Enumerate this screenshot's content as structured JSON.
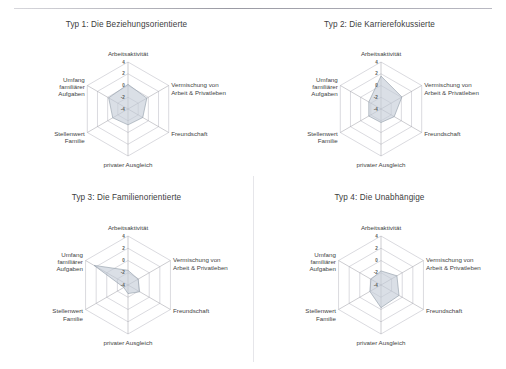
{
  "figure": {
    "kind": "radar-chart-grid",
    "panel_count": 4,
    "fill_color": "#c3ccd6",
    "grid_color": "#bcbcc4",
    "axis_color": "#9a9aa2",
    "text_color": "#3d3d3d"
  },
  "axes": {
    "labels": [
      "Arbeitsaktivität",
      "Vermischung von Arbeit & Privatleben",
      "Freundschaft",
      "privater Ausgleich",
      "Stellenwert Familie",
      "Umfang familiärer Aufgaben"
    ],
    "label_lines": [
      [
        "Arbeitsaktivität"
      ],
      [
        "Vermischung von",
        "Arbeit & Privatleben"
      ],
      [
        "Freundschaft"
      ],
      [
        "privater Ausgleich"
      ],
      [
        "Stellenwert",
        "Familie"
      ],
      [
        "Umfang",
        "familiärer",
        "Aufgaben"
      ]
    ],
    "ticks": [
      "4",
      "2",
      "0",
      "-2",
      "-4"
    ],
    "range": [
      -4,
      4
    ]
  },
  "chart_data": [
    {
      "type": "radar",
      "title": "Typ 1: Die Beziehungsorientierte",
      "categories": [
        "Arbeitsaktivität",
        "Vermischung von Arbeit & Privatleben",
        "Freundschaft",
        "privater Ausgleich",
        "Stellenwert Familie",
        "Umfang familiärer Aufgaben"
      ],
      "values": [
        0.2,
        -0.3,
        -1.1,
        -1.3,
        -1.0,
        -0.2
      ],
      "ylim": [
        -4,
        4
      ],
      "ticks": [
        "4",
        "2",
        "0",
        "-2",
        "-4"
      ],
      "grid": true,
      "legend": "none"
    },
    {
      "type": "radar",
      "title": "Typ 2: Die Karrierefokussierte",
      "categories": [
        "Arbeitsaktivität",
        "Vermischung von Arbeit & Privatleben",
        "Freundschaft",
        "privater Ausgleich",
        "Stellenwert Familie",
        "Umfang familiärer Aufgaben"
      ],
      "values": [
        1.6,
        0.1,
        -1.4,
        -1.7,
        -1.6,
        -1.6
      ],
      "ylim": [
        -4,
        4
      ],
      "ticks": [
        "4",
        "2",
        "0",
        "-2",
        "-4"
      ],
      "grid": true,
      "legend": "none"
    },
    {
      "type": "radar",
      "title": "Typ 3: Die Familienorientierte",
      "categories": [
        "Arbeitsaktivität",
        "Vermischung von Arbeit & Privatleben",
        "Freundschaft",
        "privater Ausgleich",
        "Stellenwert Familie",
        "Umfang familiärer Aufgaben"
      ],
      "values": [
        -1.6,
        -2.1,
        -1.8,
        -2.6,
        -3.2,
        2.4
      ],
      "ylim": [
        -4,
        4
      ],
      "ticks": [
        "4",
        "2",
        "0",
        "-2",
        "-4"
      ],
      "grid": true,
      "legend": "none"
    },
    {
      "type": "radar",
      "title": "Typ 4: Die Unabhängige",
      "categories": [
        "Arbeitsaktivität",
        "Vermischung von Arbeit & Privatleben",
        "Freundschaft",
        "privater Ausgleich",
        "Stellenwert Familie",
        "Umfang familiärer Aufgaben"
      ],
      "values": [
        -1.7,
        -1.0,
        -0.6,
        -0.3,
        -1.9,
        -2.1
      ],
      "ylim": [
        -4,
        4
      ],
      "ticks": [
        "4",
        "2",
        "0",
        "-2",
        "-4"
      ],
      "grid": true,
      "legend": "none"
    }
  ]
}
